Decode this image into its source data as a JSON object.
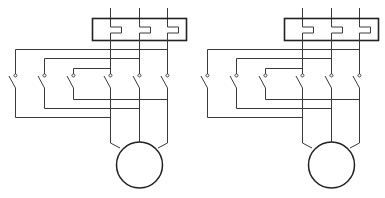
{
  "diagram": {
    "type": "electrical-schematic",
    "stroke_color": "#3a3a3a",
    "background": "#ffffff",
    "circuits": [
      {
        "id": "left",
        "offset_x": 0,
        "components": [
          "overload-relay",
          "switch-1",
          "switch-2",
          "switch-3",
          "switch-4",
          "switch-5",
          "switch-6",
          "motor"
        ]
      },
      {
        "id": "right",
        "offset_x": 192,
        "components": [
          "overload-relay",
          "switch-1",
          "switch-2",
          "switch-3",
          "switch-4",
          "switch-5",
          "switch-6",
          "motor"
        ]
      }
    ]
  }
}
